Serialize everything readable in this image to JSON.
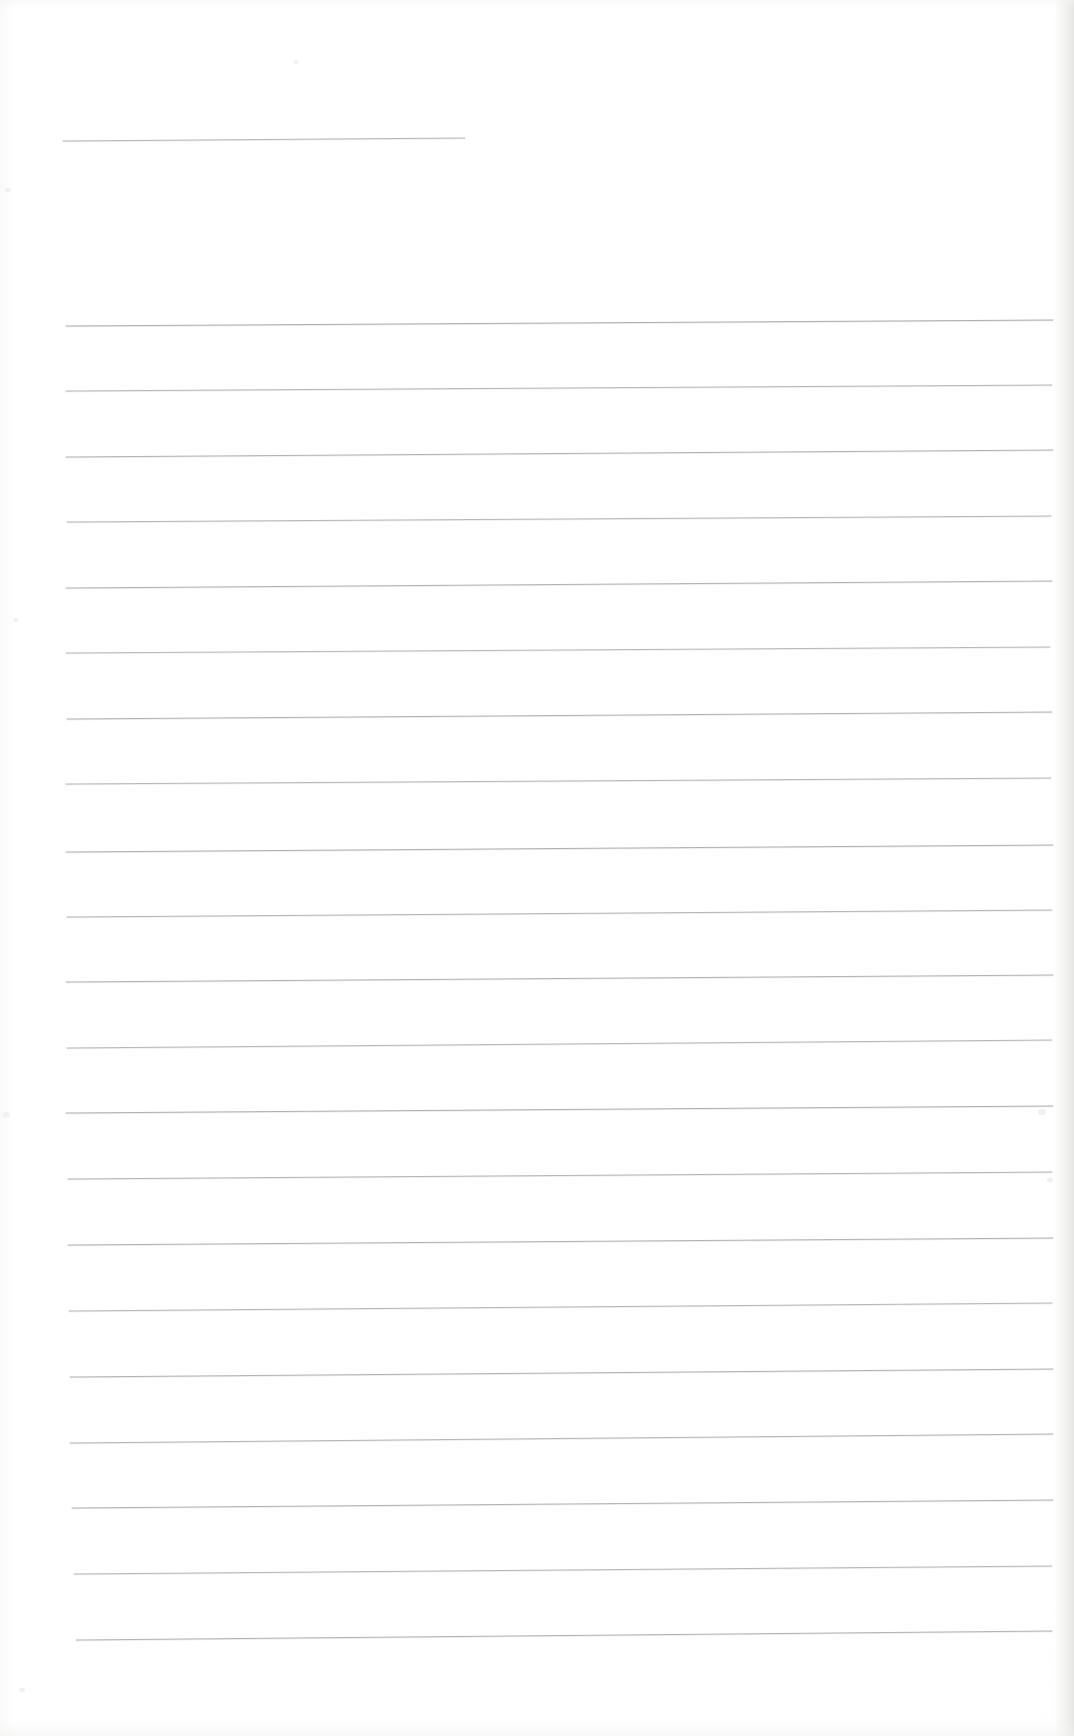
{
  "document": {
    "kind": "scanned-ruled-notepad-page",
    "description": "Blank scanned lined writing paper with faint grey horizontal ruled lines",
    "page_width": 1074,
    "page_height": 1736,
    "paper_color": "#ffffff",
    "rule_color": "#8d8d92",
    "edge_shadow_color": "#e8e8e6",
    "text_content": "",
    "visible_text": []
  },
  "ruling": {
    "line_count": 22,
    "left_margin_x": 66,
    "right_margin_x": 1053,
    "line_spacing": 65.6,
    "stroke_width": 1.0,
    "slope_note": "lines rise very slightly toward the right (scan skew)",
    "lines": [
      {
        "index": 1,
        "x1": 63,
        "y1": 141,
        "x2": 465,
        "y2": 138,
        "opacity": 0.62,
        "short": true
      },
      {
        "index": 2,
        "x1": 66,
        "y1": 326,
        "x2": 1053,
        "y2": 320,
        "opacity": 0.7,
        "short": false
      },
      {
        "index": 3,
        "x1": 66,
        "y1": 391,
        "x2": 1052,
        "y2": 385,
        "opacity": 0.62,
        "short": false
      },
      {
        "index": 4,
        "x1": 66,
        "y1": 457,
        "x2": 1053,
        "y2": 450,
        "opacity": 0.66,
        "short": false
      },
      {
        "index": 5,
        "x1": 67,
        "y1": 522,
        "x2": 1051,
        "y2": 516,
        "opacity": 0.62,
        "short": false
      },
      {
        "index": 6,
        "x1": 66,
        "y1": 588,
        "x2": 1052,
        "y2": 581,
        "opacity": 0.66,
        "short": false
      },
      {
        "index": 7,
        "x1": 66,
        "y1": 653,
        "x2": 1050,
        "y2": 647,
        "opacity": 0.6,
        "short": false
      },
      {
        "index": 8,
        "x1": 67,
        "y1": 719,
        "x2": 1052,
        "y2": 712,
        "opacity": 0.66,
        "short": false
      },
      {
        "index": 9,
        "x1": 66,
        "y1": 784,
        "x2": 1051,
        "y2": 778,
        "opacity": 0.62,
        "short": false
      },
      {
        "index": 10,
        "x1": 66,
        "y1": 852,
        "x2": 1053,
        "y2": 845,
        "opacity": 0.68,
        "short": false
      },
      {
        "index": 11,
        "x1": 67,
        "y1": 917,
        "x2": 1052,
        "y2": 910,
        "opacity": 0.64,
        "short": false
      },
      {
        "index": 12,
        "x1": 66,
        "y1": 982,
        "x2": 1053,
        "y2": 975,
        "opacity": 0.66,
        "short": false
      },
      {
        "index": 13,
        "x1": 67,
        "y1": 1048,
        "x2": 1052,
        "y2": 1040,
        "opacity": 0.62,
        "short": false
      },
      {
        "index": 14,
        "x1": 66,
        "y1": 1113,
        "x2": 1053,
        "y2": 1106,
        "opacity": 0.68,
        "short": false
      },
      {
        "index": 15,
        "x1": 68,
        "y1": 1179,
        "x2": 1052,
        "y2": 1172,
        "opacity": 0.64,
        "short": false
      },
      {
        "index": 16,
        "x1": 68,
        "y1": 1245,
        "x2": 1053,
        "y2": 1238,
        "opacity": 0.66,
        "short": false
      },
      {
        "index": 17,
        "x1": 69,
        "y1": 1311,
        "x2": 1052,
        "y2": 1303,
        "opacity": 0.62,
        "short": false
      },
      {
        "index": 18,
        "x1": 70,
        "y1": 1377,
        "x2": 1053,
        "y2": 1369,
        "opacity": 0.66,
        "short": false
      },
      {
        "index": 19,
        "x1": 70,
        "y1": 1443,
        "x2": 1053,
        "y2": 1434,
        "opacity": 0.64,
        "short": false
      },
      {
        "index": 20,
        "x1": 72,
        "y1": 1508,
        "x2": 1053,
        "y2": 1500,
        "opacity": 0.66,
        "short": false
      },
      {
        "index": 21,
        "x1": 74,
        "y1": 1574,
        "x2": 1052,
        "y2": 1566,
        "opacity": 0.62,
        "short": false
      },
      {
        "index": 22,
        "x1": 76,
        "y1": 1640,
        "x2": 1052,
        "y2": 1631,
        "opacity": 0.66,
        "short": false
      }
    ]
  },
  "specks": [
    {
      "x": 8,
      "y": 190,
      "size": 6
    },
    {
      "x": 16,
      "y": 620,
      "size": 5
    },
    {
      "x": 6,
      "y": 1115,
      "size": 7
    },
    {
      "x": 22,
      "y": 1690,
      "size": 6
    },
    {
      "x": 1042,
      "y": 1112,
      "size": 8
    },
    {
      "x": 1050,
      "y": 1180,
      "size": 6
    },
    {
      "x": 296,
      "y": 62,
      "size": 5
    }
  ]
}
